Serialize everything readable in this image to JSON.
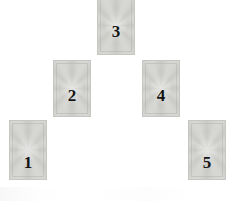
{
  "spread": {
    "name": "Five Card Pyramid Tarot Spread",
    "canvas": {
      "width": 234,
      "height": 203
    },
    "background_color": "#ffffff",
    "card_face": "back",
    "card_color": "#d6d6d3",
    "card_border_color": "#c6c6c2",
    "numeral_color": "#131313",
    "card_width": 38,
    "card_height": 58,
    "cards": [
      {
        "number": "1",
        "position_index": 1,
        "row": "bottom",
        "x": 9,
        "y": 120,
        "width": 38,
        "height": 60,
        "number_top": 33
      },
      {
        "number": "2",
        "position_index": 2,
        "row": "middle",
        "x": 53,
        "y": 60,
        "width": 38,
        "height": 57,
        "number_top": 26
      },
      {
        "number": "3",
        "position_index": 3,
        "row": "top",
        "x": 97,
        "y": -4,
        "width": 38,
        "height": 59,
        "number_top": 26
      },
      {
        "number": "4",
        "position_index": 4,
        "row": "middle",
        "x": 142,
        "y": 60,
        "width": 38,
        "height": 57,
        "number_top": 26
      },
      {
        "number": "5",
        "position_index": 5,
        "row": "bottom",
        "x": 188,
        "y": 120,
        "width": 38,
        "height": 60,
        "number_top": 33
      }
    ]
  }
}
